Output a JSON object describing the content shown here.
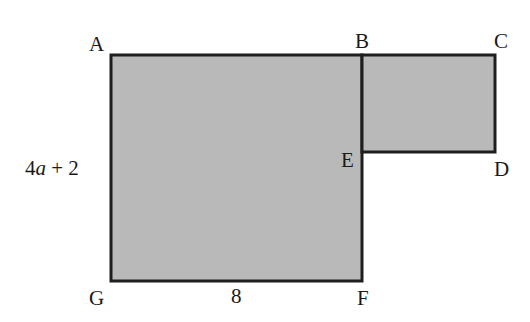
{
  "diagram": {
    "type": "composite-rectangle-figure",
    "colors": {
      "fill": "#b9b9b9",
      "stroke": "#1e1e1e",
      "text": "#1a1a1a"
    },
    "shapes": [
      {
        "name": "large-rectangle",
        "vertices": [
          "A",
          "B",
          "F",
          "G"
        ],
        "x": 111,
        "y": 55,
        "width": 251,
        "height": 226
      },
      {
        "name": "small-rectangle",
        "vertices": [
          "B",
          "C",
          "D",
          "E"
        ],
        "x": 362,
        "y": 55,
        "width": 133,
        "height": 97
      }
    ],
    "points": {
      "A": {
        "label": "A"
      },
      "B": {
        "label": "B"
      },
      "C": {
        "label": "C"
      },
      "D": {
        "label": "D"
      },
      "E": {
        "label": "E"
      },
      "F": {
        "label": "F"
      },
      "G": {
        "label": "G"
      }
    },
    "measurements": {
      "side_AG": {
        "coef": "4",
        "var": "a",
        "rest": " + 2",
        "full": "4a + 2"
      },
      "side_GF": {
        "label": "8"
      }
    }
  }
}
